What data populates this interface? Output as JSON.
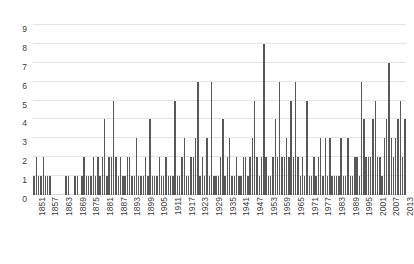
{
  "chart_data": {
    "type": "bar",
    "title": "",
    "subtitle": "",
    "xlabel": "",
    "ylabel": "",
    "ylim": [
      0,
      9
    ],
    "y_ticks": [
      0,
      1,
      2,
      3,
      4,
      5,
      6,
      7,
      8,
      9
    ],
    "grid": true,
    "legend": "none",
    "bar_color": "#585858",
    "grid_color": "#e4e4e4",
    "x_tick_step": 6,
    "x_tick_labels": [
      "1851",
      "1857",
      "1863",
      "1869",
      "1875",
      "1881",
      "1887",
      "1893",
      "1899",
      "1905",
      "1911",
      "1917",
      "1923",
      "1929",
      "1935",
      "1941",
      "1947",
      "1953",
      "1959",
      "1965",
      "1971",
      "1977",
      "1983",
      "1989",
      "1995",
      "2001",
      "2007",
      "2013"
    ],
    "x_range": [
      1851,
      2014
    ],
    "categories": [
      1851,
      1852,
      1853,
      1854,
      1855,
      1856,
      1857,
      1858,
      1859,
      1860,
      1861,
      1862,
      1863,
      1864,
      1865,
      1866,
      1867,
      1868,
      1869,
      1870,
      1871,
      1872,
      1873,
      1874,
      1875,
      1876,
      1877,
      1878,
      1879,
      1880,
      1881,
      1882,
      1883,
      1884,
      1885,
      1886,
      1887,
      1888,
      1889,
      1890,
      1891,
      1892,
      1893,
      1894,
      1895,
      1896,
      1897,
      1898,
      1899,
      1900,
      1901,
      1902,
      1903,
      1904,
      1905,
      1906,
      1907,
      1908,
      1909,
      1910,
      1911,
      1912,
      1913,
      1914,
      1915,
      1916,
      1917,
      1918,
      1919,
      1920,
      1921,
      1922,
      1923,
      1924,
      1925,
      1926,
      1927,
      1928,
      1929,
      1930,
      1931,
      1932,
      1933,
      1934,
      1935,
      1936,
      1937,
      1938,
      1939,
      1940,
      1941,
      1942,
      1943,
      1944,
      1945,
      1946,
      1947,
      1948,
      1949,
      1950,
      1951,
      1952,
      1953,
      1954,
      1955,
      1956,
      1957,
      1958,
      1959,
      1960,
      1961,
      1962,
      1963,
      1964,
      1965,
      1966,
      1967,
      1968,
      1969,
      1970,
      1971,
      1972,
      1973,
      1974,
      1975,
      1976,
      1977,
      1978,
      1979,
      1980,
      1981,
      1982,
      1983,
      1984,
      1985,
      1986,
      1987,
      1988,
      1989,
      1990,
      1991,
      1992,
      1993,
      1994,
      1995,
      1996,
      1997,
      1998,
      1999,
      2000,
      2001,
      2002,
      2003,
      2004,
      2005,
      2006,
      2007,
      2008,
      2009,
      2010,
      2011,
      2012,
      2013,
      2014
    ],
    "values": [
      1,
      2,
      1,
      1,
      2,
      1,
      1,
      1,
      0,
      0,
      0,
      0,
      0,
      0,
      1,
      1,
      0,
      0,
      1,
      1,
      0,
      1,
      2,
      1,
      1,
      1,
      2,
      1,
      2,
      1,
      2,
      4,
      1,
      2,
      2,
      5,
      2,
      1,
      2,
      1,
      1,
      2,
      2,
      1,
      1,
      3,
      1,
      1,
      1,
      2,
      1,
      4,
      1,
      1,
      1,
      2,
      1,
      1,
      2,
      1,
      1,
      1,
      5,
      1,
      1,
      2,
      3,
      1,
      1,
      2,
      2,
      3,
      6,
      1,
      2,
      1,
      3,
      1,
      6,
      1,
      1,
      1,
      2,
      4,
      1,
      2,
      3,
      1,
      1,
      2,
      1,
      1,
      2,
      2,
      1,
      2,
      3,
      5,
      2,
      1,
      2,
      8,
      2,
      1,
      1,
      2,
      4,
      2,
      6,
      2,
      2,
      3,
      2,
      5,
      2,
      6,
      2,
      1,
      2,
      1,
      5,
      1,
      1,
      2,
      1,
      2,
      3,
      1,
      3,
      1,
      3,
      1,
      1,
      1,
      1,
      3,
      1,
      1,
      3,
      1,
      1,
      2,
      2,
      1,
      6,
      4,
      2,
      2,
      2,
      4,
      5,
      2,
      2,
      1,
      3,
      4,
      7,
      3,
      2,
      3,
      4,
      5,
      2,
      4
    ]
  }
}
